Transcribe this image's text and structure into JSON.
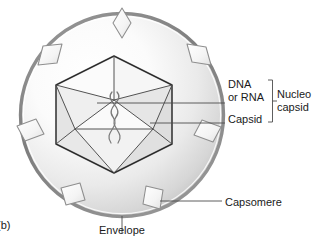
{
  "figure": {
    "panel_letter": "(b)",
    "background_color": "#ffffff",
    "line_color": "#3a3a3a",
    "envelope_ring_color": "#8c8c8c",
    "capsomere_fill": "#f2f2f2",
    "text_color": "#1a1a1a"
  },
  "labels": {
    "dna": "DNA",
    "or_rna": "or RNA",
    "capsid": "Capsid",
    "nucleo": "Nucleo",
    "capsid_word": "capsid",
    "capsomere": "Capsomere",
    "envelope": "Envelope"
  },
  "parts": {
    "envelope": {
      "name": "Envelope",
      "shape": "circle",
      "center": [
        122,
        115
      ],
      "radius": 102,
      "ring_width": 3
    },
    "nucleocapsid": {
      "name": "Nucleocapsid",
      "components": [
        "DNA or RNA",
        "Capsid"
      ]
    },
    "capsid": {
      "name": "Capsid",
      "shape": "icosahedron",
      "center": [
        114,
        114
      ],
      "radius": 58
    },
    "genome": {
      "name": "DNA or RNA",
      "shape": "double-helix-strand"
    },
    "capsomeres": {
      "name": "Capsomere",
      "count": 8,
      "shape": "diamond-spike"
    }
  },
  "leaders": {
    "dna_line": {
      "from": [
        97,
        103
      ],
      "to": [
        225,
        103
      ]
    },
    "capsid_line": {
      "from": [
        150,
        123
      ],
      "to": [
        225,
        123
      ]
    },
    "capsomere_line": {
      "from": [
        160,
        201
      ],
      "to": [
        222,
        201
      ]
    },
    "envelope_line": {
      "from": [
        122,
        216
      ],
      "to": [
        122,
        232
      ]
    },
    "bracket": {
      "x": 272,
      "top": 80,
      "bottom": 122,
      "tick_x": 266,
      "tick_y": 101
    }
  }
}
